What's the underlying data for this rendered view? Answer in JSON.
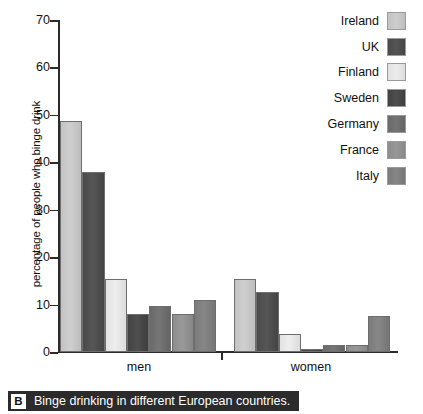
{
  "chart_data": {
    "type": "bar",
    "title": "",
    "xlabel": "",
    "ylabel": "percentage of people who binge drink",
    "ylim": [
      0,
      70
    ],
    "yticks": [
      0,
      10,
      20,
      30,
      40,
      50,
      60,
      70
    ],
    "grid": false,
    "legend_position": "top-right",
    "categories": [
      "men",
      "women"
    ],
    "series": [
      {
        "name": "Ireland",
        "color": "#c3c3c3",
        "values": [
          48.7,
          15.4
        ]
      },
      {
        "name": "UK",
        "color": "#4a4a4a",
        "values": [
          38.0,
          12.7
        ]
      },
      {
        "name": "Finland",
        "color": "#e2e2e2",
        "values": [
          15.3,
          3.8
        ]
      },
      {
        "name": "Sweden",
        "color": "#434343",
        "values": [
          8.0,
          0.7
        ]
      },
      {
        "name": "Germany",
        "color": "#6a6a6a",
        "values": [
          9.7,
          1.5
        ]
      },
      {
        "name": "France",
        "color": "#8d8d8d",
        "values": [
          8.0,
          1.5
        ]
      },
      {
        "name": "Italy",
        "color": "#7b7b7b",
        "values": [
          11.0,
          7.5
        ]
      }
    ]
  },
  "legend": {
    "items": [
      {
        "label": "Ireland",
        "color": "#c3c3c3"
      },
      {
        "label": "UK",
        "color": "#4a4a4a"
      },
      {
        "label": "Finland",
        "color": "#e2e2e2"
      },
      {
        "label": "Sweden",
        "color": "#434343"
      },
      {
        "label": "Germany",
        "color": "#6a6a6a"
      },
      {
        "label": "France",
        "color": "#8d8d8d"
      },
      {
        "label": "Italy",
        "color": "#7b7b7b"
      }
    ]
  },
  "axis": {
    "ylabel": "percentage of people who binge drink",
    "tick_labels": [
      "70",
      "60",
      "50",
      "40",
      "30",
      "20",
      "10",
      "0"
    ],
    "group_labels": [
      "men",
      "women"
    ]
  },
  "caption": {
    "badge": "B",
    "text": "Binge drinking in different European countries."
  }
}
